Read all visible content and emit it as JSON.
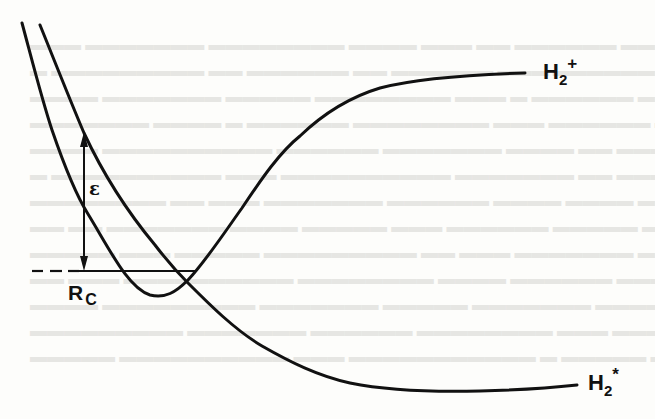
{
  "figure": {
    "type": "potential-energy-curves",
    "background_bleed_through_text": true
  },
  "curves": [
    {
      "id": "H2+",
      "label_base": "H",
      "label_subscript": "2",
      "label_superscript": "+",
      "description": "Ion potential curve: steep repulsive wall at left, shallow well near Rc, rising to asymptote at upper right"
    },
    {
      "id": "H2*",
      "label_base": "H",
      "label_subscript": "2",
      "label_superscript": "*",
      "description": "Excited (doubly-excited / repulsive) state curve descending from upper left, crossing H2+ near Rc, leveling to asymptote at lower right"
    }
  ],
  "annotations": {
    "epsilon": {
      "symbol": "ε",
      "description": "Vertical double-headed arrow marking energy gap between curves"
    },
    "crossing_radius": {
      "base": "R",
      "subscript": "C",
      "description": "Dashed horizontal line marking the crossing point"
    }
  },
  "colors": {
    "ink": "#111111",
    "paper": "#fdfdfb",
    "bleed": "#e6e6e3"
  }
}
